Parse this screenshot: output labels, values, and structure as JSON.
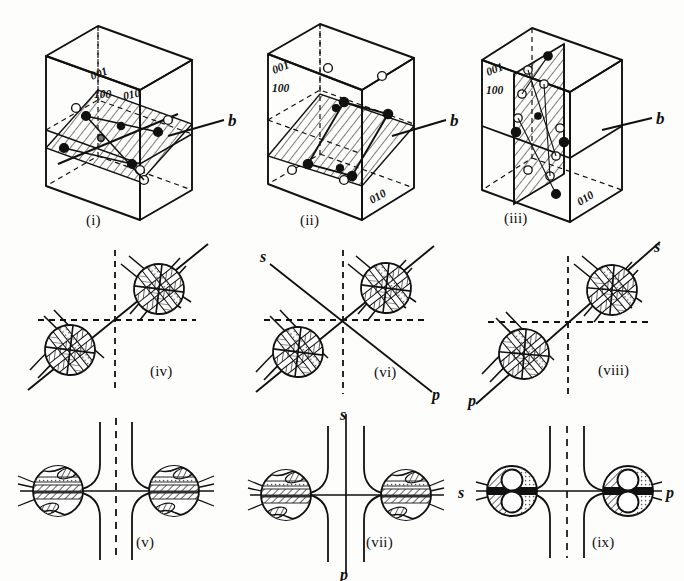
{
  "figure": {
    "kind": "optical-crystallography-plate",
    "rows": 3,
    "cols": 3,
    "background": "#fdfdfc",
    "ink": "#111111"
  },
  "panels": [
    {
      "id": "i",
      "caption": "(i)",
      "type": "unit-cell-block",
      "miller_indices": [
        "001",
        "100",
        "010"
      ],
      "twin_label": "b",
      "description": "orthorhombic cell with inclined hatched composition plane"
    },
    {
      "id": "ii",
      "caption": "(ii)",
      "type": "unit-cell-block",
      "miller_indices": [
        "001",
        "100",
        "010"
      ],
      "twin_label": "b",
      "description": "cell with inclined hatched plane and open/filled atom sites"
    },
    {
      "id": "iii",
      "caption": "(iii)",
      "type": "unit-cell-block",
      "miller_indices": [
        "001",
        "100",
        "010"
      ],
      "twin_label": "b",
      "description": "cell with vertical hatched composition plane"
    },
    {
      "id": "iv",
      "caption": "(iv)",
      "type": "interference-figure-oblique",
      "axis_labels": [],
      "melatopes": 2,
      "diagonal": "rising",
      "description": "off-centre bxa figure, two melatopes on a NE-SW diagonal"
    },
    {
      "id": "vi",
      "caption": "(vi)",
      "type": "interference-figure-oblique",
      "axis_labels": [
        "s",
        "p"
      ],
      "s_position": "upper-left",
      "p_position": "lower-right",
      "melatopes": 2,
      "diagonal": "rising",
      "description": "figure with trace s-p descending through centre"
    },
    {
      "id": "viii",
      "caption": "(viii)",
      "type": "interference-figure-oblique",
      "axis_labels": [
        "s",
        "p"
      ],
      "s_position": "upper-right",
      "p_position": "lower-left",
      "melatopes": 2,
      "diagonal": "rising",
      "description": "figure with trace p-s ascending through centre"
    },
    {
      "id": "v",
      "caption": "(v)",
      "type": "interference-figure-centred",
      "axis_labels": [],
      "melatopes": 2,
      "description": "centred figure, isogyres opening left and right"
    },
    {
      "id": "vii",
      "caption": "(vii)",
      "type": "interference-figure-centred",
      "axis_labels": [
        "s",
        "p"
      ],
      "s_position": "top",
      "p_position": "bottom",
      "melatopes": 2,
      "description": "centred figure with vertical s-p trace"
    },
    {
      "id": "ix",
      "caption": "(ix)",
      "type": "interference-figure-centred",
      "axis_labels": [
        "s",
        "p"
      ],
      "s_position": "left",
      "p_position": "right",
      "melatopes": 2,
      "description": "centred figure with horizontal s-p trace and lobed melatopes"
    }
  ],
  "captions": {
    "i": "(i)",
    "ii": "(ii)",
    "iii": "(iii)",
    "iv": "(iv)",
    "v": "(v)",
    "vi": "(vi)",
    "vii": "(vii)",
    "viii": "(viii)",
    "ix": "(ix)"
  },
  "labels": {
    "b": "b",
    "s": "s",
    "p": "p",
    "m001": "001",
    "m100": "100",
    "m010": "010"
  }
}
